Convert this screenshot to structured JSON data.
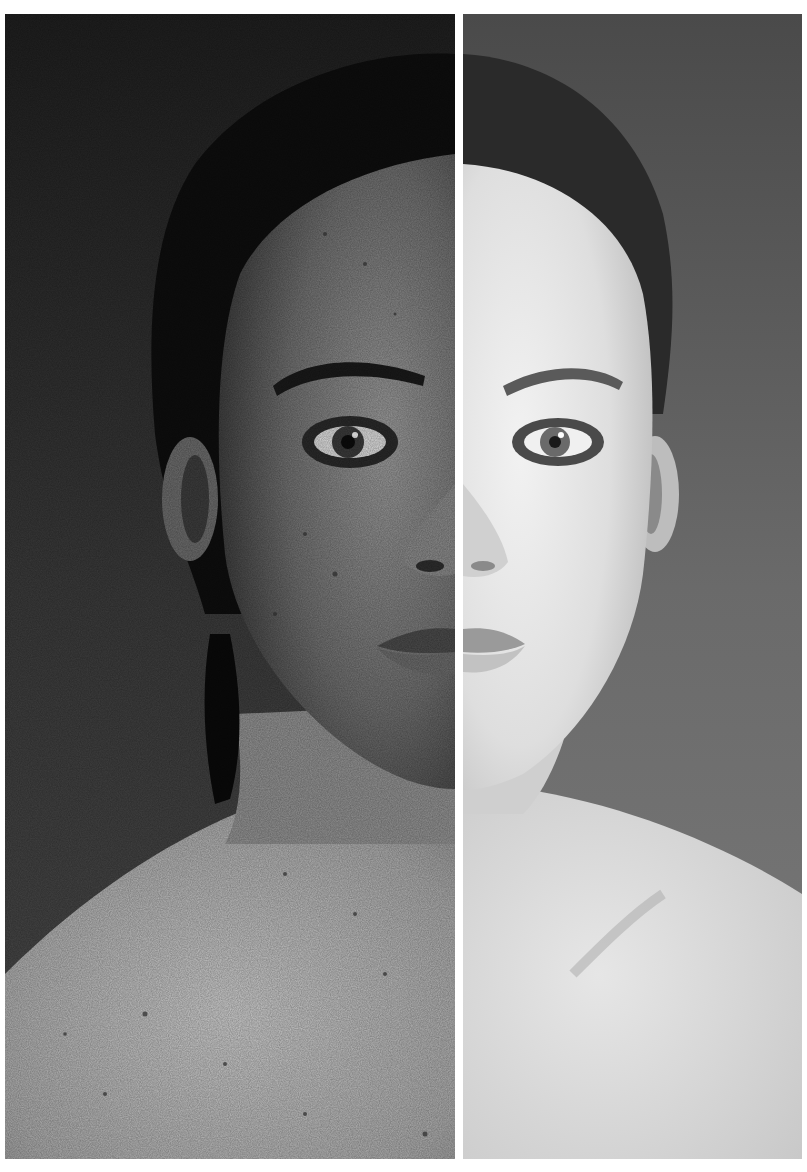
{
  "image": {
    "description": "Black-and-white split-face portrait comparison of a woman; left half shows sun-damaged, freckled, textured skin on darker tones; right half shows smooth, even, bright skin.",
    "layout": "two vertical panels separated by a thin white divider",
    "panels": [
      {
        "id": "left",
        "label": "",
        "tone": "dark, high-texture, spotted skin"
      },
      {
        "id": "right",
        "label": "",
        "tone": "light, smooth skin"
      }
    ],
    "colors": {
      "background_left": "#2b2b2b",
      "background_right": "#5a5a5a",
      "hair": "#0e0e0e",
      "skin_left": "#7d7d7d",
      "skin_left_light": "#b5b5b5",
      "skin_right": "#d6d6d6",
      "skin_right_light": "#eeeeee",
      "divider": "#ffffff",
      "border": "#ffffff"
    }
  }
}
